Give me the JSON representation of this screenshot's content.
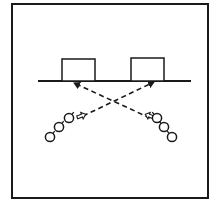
{
  "diagram": {
    "type": "drill-diagram",
    "colors": {
      "stroke": "#1a1a1a",
      "background": "#ffffff"
    },
    "frame": {
      "x": 12,
      "y": 4,
      "width": 196,
      "height": 194
    },
    "baseline": {
      "x1": 38,
      "y1": 81,
      "x2": 191,
      "y2": 81
    },
    "boxes": [
      {
        "id": "left-box",
        "x": 62,
        "y": 59,
        "width": 33,
        "height": 22
      },
      {
        "id": "right-box",
        "x": 131,
        "y": 58,
        "width": 33,
        "height": 23
      }
    ],
    "paths": [
      {
        "id": "pass-left-to-right",
        "x1": 83,
        "y1": 116,
        "x2": 154,
        "y2": 82,
        "dashed": true,
        "arrow_end": true
      },
      {
        "id": "pass-right-to-left",
        "x1": 150,
        "y1": 118,
        "x2": 74,
        "y2": 83,
        "dashed": true,
        "arrow_end": true
      }
    ],
    "movement_arrows": [
      {
        "id": "left-hollow-arrow",
        "x": 81,
        "y": 116,
        "direction": "right"
      },
      {
        "id": "right-hollow-arrow",
        "x": 150,
        "y": 116,
        "direction": "left"
      }
    ],
    "player_groups": [
      {
        "id": "left-group",
        "players": [
          {
            "cx": 50,
            "cy": 137
          },
          {
            "cx": 59,
            "cy": 127
          },
          {
            "cx": 69,
            "cy": 118
          }
        ]
      },
      {
        "id": "right-group",
        "players": [
          {
            "cx": 157,
            "cy": 118
          },
          {
            "cx": 164,
            "cy": 127
          },
          {
            "cx": 172,
            "cy": 137
          }
        ]
      }
    ]
  }
}
